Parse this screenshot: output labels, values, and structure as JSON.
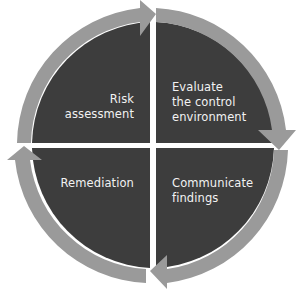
{
  "diagram": {
    "type": "cycle",
    "colors": {
      "quadrant": "#3d3d3d",
      "arrow": "#9a9a9a",
      "text": "#f2f2f2",
      "background": "#ffffff"
    },
    "quadrants": [
      {
        "position": "top-left",
        "label": "Risk\nassessment"
      },
      {
        "position": "top-right",
        "label": "Evaluate\nthe control\nenvironment"
      },
      {
        "position": "bottom-right",
        "label": "Communicate\nfindings"
      },
      {
        "position": "bottom-left",
        "label": "Remediation"
      }
    ],
    "arrows": [
      {
        "segment": "top-left",
        "direction": "clockwise"
      },
      {
        "segment": "top-right",
        "direction": "clockwise"
      },
      {
        "segment": "bottom-right",
        "direction": "clockwise"
      },
      {
        "segment": "bottom-left",
        "direction": "clockwise"
      }
    ]
  }
}
